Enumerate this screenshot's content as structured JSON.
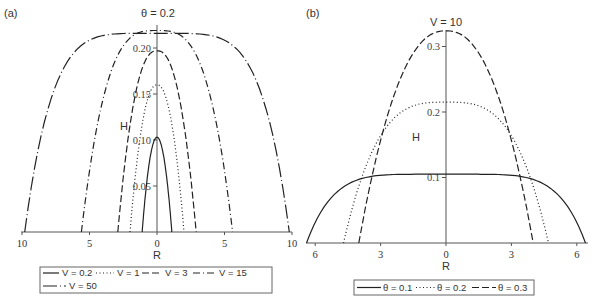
{
  "chart_data": [
    {
      "panel_label": "(a)",
      "type": "line",
      "title": "θ = 0.2",
      "xlabel": "R",
      "ylabel": "H",
      "xlim": [
        -10,
        10
      ],
      "ylim": [
        0,
        0.22
      ],
      "x_tick_labels": [
        "10",
        "5",
        "0",
        "5",
        "10"
      ],
      "x_ticks": [
        -10,
        -5,
        0,
        5,
        10
      ],
      "y_ticks": [
        0.05,
        0.1,
        0.15,
        0.2
      ],
      "y_tick_labels": [
        "0.05",
        "0.10",
        "0.15",
        "0.20"
      ],
      "grid": false,
      "legend_position": "bottom",
      "series": [
        {
          "name": "V = 0.2",
          "style": "solid",
          "peak_H": 0.103,
          "R_edge": 1.1,
          "shape": 2.0
        },
        {
          "name": "V = 1",
          "style": "dotted",
          "peak_H": 0.16,
          "R_edge": 2.0,
          "shape": 2.2
        },
        {
          "name": "V = 3",
          "style": "dashed",
          "peak_H": 0.197,
          "R_edge": 2.9,
          "shape": 2.4
        },
        {
          "name": "V = 15",
          "style": "dashdot",
          "peak_H": 0.219,
          "R_edge": 5.6,
          "shape": 3.2
        },
        {
          "name": "V = 50",
          "style": "longdash",
          "peak_H": 0.216,
          "R_edge": 9.8,
          "shape": 5.0
        }
      ]
    },
    {
      "panel_label": "(b)",
      "type": "line",
      "title": "V = 10",
      "xlabel": "R",
      "ylabel": "H",
      "xlim": [
        -6.4,
        6.4
      ],
      "ylim": [
        0,
        0.33
      ],
      "x_ticks": [
        -6,
        -3,
        0,
        3,
        6
      ],
      "x_tick_labels": [
        "6",
        "3",
        "0",
        "3",
        "6"
      ],
      "y_ticks": [
        0.1,
        0.2,
        0.3
      ],
      "y_tick_labels": [
        "0.1",
        "0.2",
        "0.3"
      ],
      "grid": false,
      "legend_position": "bottom",
      "series": [
        {
          "name": "θ = 0.1",
          "style": "solid",
          "peak_H": 0.105,
          "R_edge": 6.4,
          "shape": 5.5
        },
        {
          "name": "θ = 0.2",
          "style": "dotted",
          "peak_H": 0.215,
          "R_edge": 4.7,
          "shape": 3.2
        },
        {
          "name": "θ = 0.3",
          "style": "dashed",
          "peak_H": 0.324,
          "R_edge": 4.0,
          "shape": 2.3
        }
      ]
    }
  ],
  "legend_a": {
    "row1": [
      "V = 0.2",
      "V = 1",
      "V = 3",
      "V = 15"
    ],
    "row2": [
      "V = 50"
    ]
  },
  "legend_b": [
    "θ = 0.1",
    "θ = 0.2",
    "θ = 0.3"
  ]
}
